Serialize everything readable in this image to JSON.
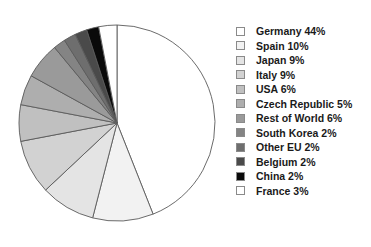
{
  "chart_data": {
    "type": "pie",
    "title": "",
    "start_angle_deg": 0,
    "direction": "clockwise",
    "legend_position": "right",
    "grid": false,
    "background": "#ffffff",
    "outline_color": "#5a5a5a",
    "categories": [
      "Germany",
      "Spain",
      "Japan",
      "Italy",
      "USA",
      "Czech Republic",
      "Rest of World",
      "South Korea",
      "Other EU",
      "Belgium",
      "China",
      "France"
    ],
    "values": [
      44,
      10,
      9,
      9,
      6,
      5,
      6,
      2,
      2,
      2,
      2,
      3
    ],
    "value_suffix": "%",
    "colors": [
      "#ffffff",
      "#f2f2f2",
      "#e4e4e4",
      "#d2d2d2",
      "#c0c0c0",
      "#aeaeae",
      "#9a9a9a",
      "#848484",
      "#6e6e6e",
      "#4a4a4a",
      "#0a0a0a",
      "#ffffff"
    ],
    "legend_items": [
      {
        "label": "Germany 44%",
        "color": "#ffffff"
      },
      {
        "label": "Spain 10%",
        "color": "#f2f2f2"
      },
      {
        "label": "Japan 9%",
        "color": "#e4e4e4"
      },
      {
        "label": "Italy 9%",
        "color": "#d2d2d2"
      },
      {
        "label": "USA 6%",
        "color": "#c0c0c0"
      },
      {
        "label": "Czech Republic 5%",
        "color": "#aeaeae"
      },
      {
        "label": "Rest of World 6%",
        "color": "#9a9a9a"
      },
      {
        "label": "South Korea 2%",
        "color": "#848484"
      },
      {
        "label": "Other EU 2%",
        "color": "#6e6e6e"
      },
      {
        "label": "Belgium 2%",
        "color": "#4a4a4a"
      },
      {
        "label": "China 2%",
        "color": "#0a0a0a"
      },
      {
        "label": "France 3%",
        "color": "#ffffff"
      }
    ]
  }
}
